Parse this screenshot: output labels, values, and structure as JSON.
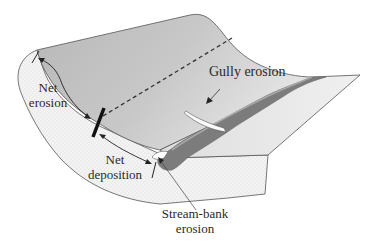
{
  "diagram": {
    "type": "hillslope erosion schematic",
    "labels": {
      "net_erosion": [
        "Net",
        "erosion"
      ],
      "net_deposition": [
        "Net",
        "deposition"
      ],
      "gully_erosion": "Gully erosion",
      "stream_bank_erosion": [
        "Stream-bank",
        "erosion"
      ]
    },
    "colors": {
      "background": "#ffffff",
      "slope_surface_light": "#e8e8e8",
      "slope_surface_dark": "#b4b4b4",
      "cross_section": "#f2f2f2",
      "stream_channel": "#7a7a7a",
      "stream_edge": "#9a9a9a",
      "gully": "#f8f8f8",
      "outline": "#555555",
      "marker": "#111111"
    }
  }
}
